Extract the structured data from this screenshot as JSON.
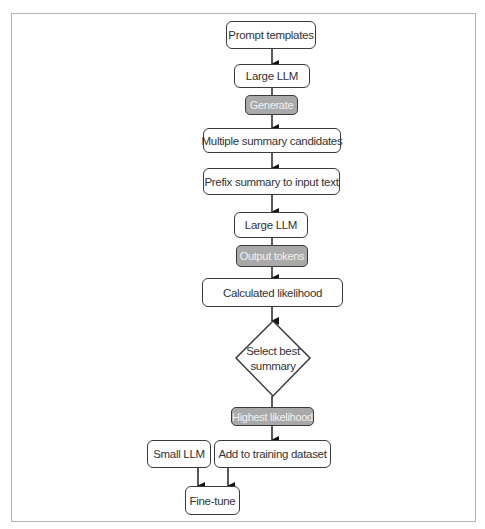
{
  "diagram": {
    "type": "flowchart",
    "nodes": {
      "prompt_templates": "Prompt templates",
      "large_llm_1": "Large LLM",
      "generate": "Generate",
      "multiple_candidates": "Multiple summary candidates",
      "prefix_summary": "Prefix summary to input text",
      "large_llm_2": "Large LLM",
      "output_tokens": "Output tokens",
      "calculated_likelihood": "Calculated likelihood",
      "select_best_line1": "Select best",
      "select_best_line2": "summary",
      "highest_likelihood": "Highest likelihood",
      "small_llm": "Small LLM",
      "add_to_dataset": "Add to training dataset",
      "fine_tune": "Fine-tune"
    },
    "edges": [
      {
        "from": "Prompt templates",
        "to": "Large LLM"
      },
      {
        "from": "Large LLM",
        "to": "Multiple summary candidates",
        "label": "Generate"
      },
      {
        "from": "Multiple summary candidates",
        "to": "Prefix summary to input text"
      },
      {
        "from": "Prefix summary to input text",
        "to": "Large LLM"
      },
      {
        "from": "Large LLM",
        "to": "Calculated likelihood",
        "label": "Output tokens"
      },
      {
        "from": "Calculated likelihood",
        "to": "Select best summary"
      },
      {
        "from": "Select best summary",
        "to": "Add to training dataset",
        "label": "Highest likelihood"
      },
      {
        "from": "Small LLM",
        "to": "Fine-tune"
      },
      {
        "from": "Add to training dataset",
        "to": "Fine-tune"
      }
    ],
    "colors": {
      "border": "#3a3a3a",
      "edge_label_fill": "#a9a9a9",
      "edge_label_text": "#f2f2f2",
      "frame": "#b4b4b4"
    }
  }
}
